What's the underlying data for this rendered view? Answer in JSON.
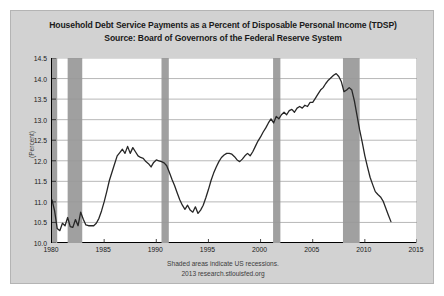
{
  "chart_data": {
    "type": "line",
    "title": "Household Debt Service Payments as a Percent of Disposable Personal Income (TDSP)",
    "subtitle": "Source: Board of Governors of the Federal Reserve System",
    "xlabel": "",
    "ylabel": "(Percent)",
    "xlim": [
      1980,
      2015
    ],
    "ylim": [
      10.0,
      14.5
    ],
    "xticks": [
      1980,
      1985,
      1990,
      1995,
      2000,
      2005,
      2010,
      2015
    ],
    "xtick_labels": [
      "1980",
      "1985",
      "1990",
      "1995",
      "2000",
      "2005",
      "2010",
      "2015"
    ],
    "yticks": [
      10.0,
      10.5,
      11.0,
      11.5,
      12.0,
      12.5,
      13.0,
      13.5,
      14.0,
      14.5
    ],
    "ytick_labels": [
      "10.0",
      "10.5",
      "11.0",
      "11.5",
      "12.0",
      "12.5",
      "13.0",
      "13.5",
      "14.0",
      "14.5"
    ],
    "grid": true,
    "grid_axis": "y",
    "legend": null,
    "line_color": "#262626",
    "recession_color": "#a0a0a0",
    "plot_background": "#ffffff",
    "figure_background": "#d2d2d2",
    "recessions": [
      {
        "start": 1980.0,
        "end": 1980.5
      },
      {
        "start": 1981.5,
        "end": 1982.9
      },
      {
        "start": 1990.5,
        "end": 1991.2
      },
      {
        "start": 2001.2,
        "end": 2001.9
      },
      {
        "start": 2007.9,
        "end": 2009.5
      }
    ],
    "series": [
      {
        "name": "TDSP",
        "x": [
          1980.0,
          1980.25,
          1980.5,
          1980.75,
          1981.0,
          1981.25,
          1981.5,
          1981.75,
          1982.0,
          1982.25,
          1982.5,
          1982.75,
          1983.0,
          1983.25,
          1983.5,
          1983.75,
          1984.0,
          1984.25,
          1984.5,
          1984.75,
          1985.0,
          1985.25,
          1985.5,
          1985.75,
          1986.0,
          1986.25,
          1986.5,
          1986.75,
          1987.0,
          1987.25,
          1987.5,
          1987.75,
          1988.0,
          1988.25,
          1988.5,
          1988.75,
          1989.0,
          1989.25,
          1989.5,
          1989.75,
          1990.0,
          1990.25,
          1990.5,
          1990.75,
          1991.0,
          1991.25,
          1991.5,
          1991.75,
          1992.0,
          1992.25,
          1992.5,
          1992.75,
          1993.0,
          1993.25,
          1993.5,
          1993.75,
          1994.0,
          1994.25,
          1994.5,
          1994.75,
          1995.0,
          1995.25,
          1995.5,
          1995.75,
          1996.0,
          1996.25,
          1996.5,
          1996.75,
          1997.0,
          1997.25,
          1997.5,
          1997.75,
          1998.0,
          1998.25,
          1998.5,
          1998.75,
          1999.0,
          1999.25,
          1999.5,
          1999.75,
          2000.0,
          2000.25,
          2000.5,
          2000.75,
          2001.0,
          2001.25,
          2001.5,
          2001.75,
          2002.0,
          2002.25,
          2002.5,
          2002.75,
          2003.0,
          2003.25,
          2003.5,
          2003.75,
          2004.0,
          2004.25,
          2004.5,
          2004.75,
          2005.0,
          2005.25,
          2005.5,
          2005.75,
          2006.0,
          2006.25,
          2006.5,
          2006.75,
          2007.0,
          2007.25,
          2007.5,
          2007.75,
          2008.0,
          2008.25,
          2008.5,
          2008.75,
          2009.0,
          2009.25,
          2009.5,
          2009.75,
          2010.0,
          2010.25,
          2010.5,
          2010.75,
          2011.0,
          2011.25,
          2011.5,
          2011.75,
          2012.0,
          2012.25,
          2012.5
        ],
        "y": [
          11.05,
          10.78,
          10.35,
          10.3,
          10.48,
          10.42,
          10.62,
          10.4,
          10.38,
          10.57,
          10.42,
          10.75,
          10.58,
          10.44,
          10.42,
          10.42,
          10.42,
          10.48,
          10.6,
          10.78,
          11.0,
          11.25,
          11.52,
          11.72,
          11.92,
          12.12,
          12.2,
          12.28,
          12.18,
          12.35,
          12.18,
          12.32,
          12.22,
          12.12,
          12.08,
          12.06,
          11.98,
          11.93,
          11.85,
          11.96,
          12.02,
          12.0,
          11.98,
          11.95,
          11.88,
          11.72,
          11.55,
          11.4,
          11.22,
          11.05,
          10.92,
          10.82,
          10.92,
          10.8,
          10.75,
          10.88,
          10.72,
          10.8,
          10.92,
          11.1,
          11.3,
          11.52,
          11.7,
          11.85,
          11.98,
          12.08,
          12.14,
          12.18,
          12.18,
          12.16,
          12.1,
          12.02,
          11.98,
          12.04,
          12.12,
          12.18,
          12.12,
          12.22,
          12.35,
          12.48,
          12.58,
          12.7,
          12.8,
          12.92,
          13.02,
          12.92,
          13.08,
          13.02,
          13.12,
          13.18,
          13.12,
          13.22,
          13.25,
          13.18,
          13.28,
          13.32,
          13.28,
          13.35,
          13.32,
          13.42,
          13.42,
          13.52,
          13.62,
          13.72,
          13.78,
          13.88,
          13.96,
          14.02,
          14.08,
          14.12,
          14.05,
          13.92,
          13.68,
          13.72,
          13.78,
          13.72,
          13.45,
          13.1,
          12.75,
          12.45,
          12.12,
          11.85,
          11.6,
          11.42,
          11.25,
          11.18,
          11.12,
          11.02,
          10.85,
          10.68,
          10.52
        ]
      }
    ],
    "annotations": [
      "Shaded areas indicate US recessions.",
      "2013 research.stlouisfed.org"
    ]
  },
  "footer": {
    "line1": "Shaded areas indicate US recessions.",
    "line2": "2013 research.stlouisfed.org"
  }
}
